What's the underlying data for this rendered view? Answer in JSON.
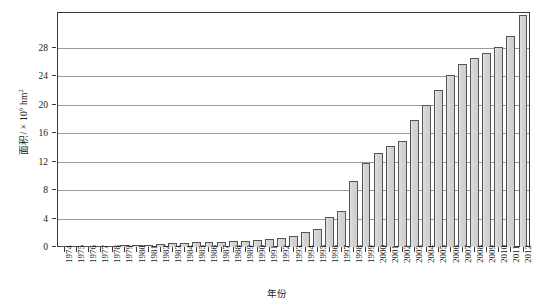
{
  "chart_data": {
    "type": "bar",
    "title": "",
    "xlabel": "年份",
    "ylabel": "面积/ × 10⁶ hm²",
    "ylabel_base": "面积/ × 10",
    "ylabel_exp": "6",
    "ylabel_unit": " hm",
    "ylabel_unit_exp": "2",
    "ylim": [
      0,
      33
    ],
    "ytick_labels": [
      "0",
      "4",
      "8",
      "12",
      "16",
      "20",
      "24",
      "28"
    ],
    "ytick_values": [
      0,
      4,
      8,
      12,
      16,
      20,
      24,
      28
    ],
    "grid": true,
    "legend": "none",
    "categories": [
      "1974",
      "1975",
      "1976",
      "1977",
      "1978",
      "1979",
      "1980",
      "1981",
      "1982",
      "1983",
      "1984",
      "1985",
      "1986",
      "1987",
      "1988",
      "1989",
      "1990",
      "1991",
      "1992",
      "1993",
      "1994",
      "1995",
      "1996",
      "1997",
      "1998",
      "1999",
      "2000",
      "2001",
      "2002",
      "2003",
      "2004",
      "2005",
      "2006",
      "2007",
      "2008",
      "2009",
      "2010",
      "2011",
      "2012"
    ],
    "values": [
      0.05,
      0.08,
      0.15,
      0.17,
      0.2,
      0.25,
      0.3,
      0.35,
      0.45,
      0.5,
      0.6,
      0.65,
      0.7,
      0.75,
      0.85,
      0.9,
      1.0,
      1.1,
      1.3,
      1.6,
      2.1,
      2.6,
      4.2,
      5.0,
      9.3,
      11.8,
      13.2,
      14.2,
      14.9,
      17.8,
      20.0,
      22.1,
      24.2,
      25.7,
      26.6,
      27.2,
      28.1,
      29.6,
      32.6
    ],
    "bar_fill": "#d3d3d3",
    "bar_stroke": "#555555",
    "axis_color": "#3a3a3a",
    "grid_color": "#9a9a9a",
    "background": "#ffffff"
  }
}
